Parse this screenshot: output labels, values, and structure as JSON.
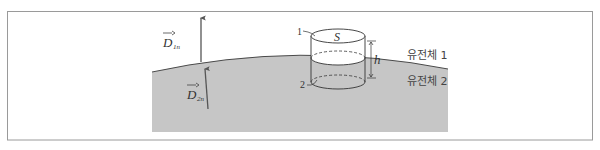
{
  "diagram": {
    "vectors": {
      "upper": {
        "symbol": "D",
        "subscript": "1n"
      },
      "lower": {
        "symbol": "D",
        "subscript": "2n"
      }
    },
    "cylinder": {
      "top_face_label": "S",
      "height_label": "h",
      "top_marker": "1",
      "bottom_marker": "2"
    },
    "fluids": {
      "upper": "유전체 1",
      "lower": "유전체 2"
    },
    "colors": {
      "lower_medium_fill": "#c6c6c6",
      "line": "#4a4a4a",
      "frame": "#9a9a9a",
      "arrow": "#555555"
    }
  }
}
